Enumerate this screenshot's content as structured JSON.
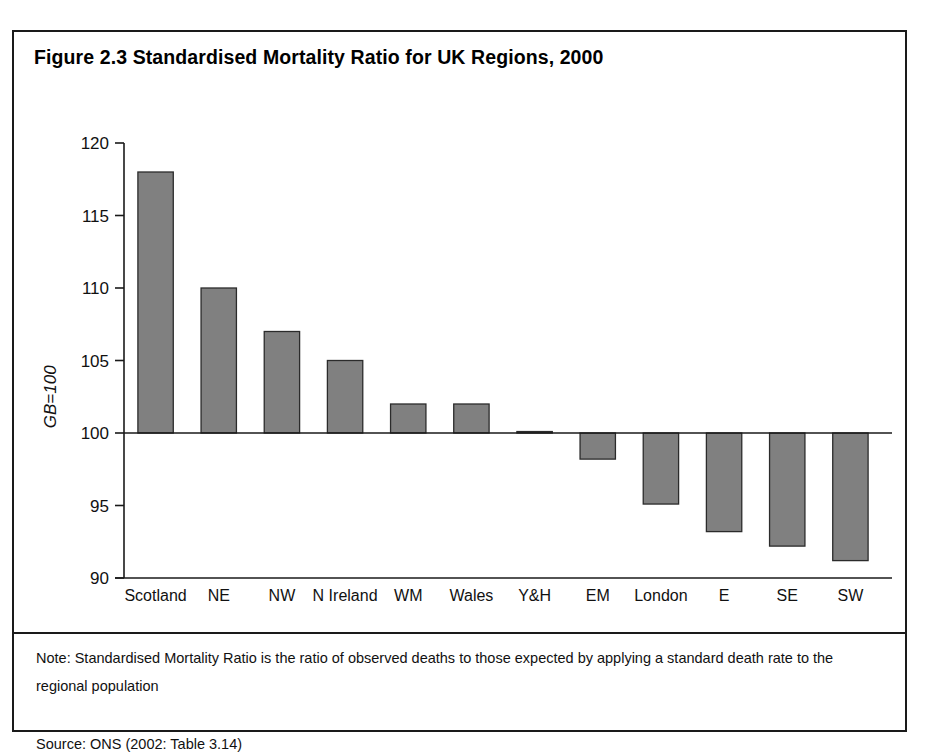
{
  "figure": {
    "title": "Figure 2.3 Standardised Mortality Ratio for UK Regions, 2000",
    "note": "Note: Standardised Mortality Ratio is the ratio of observed deaths to those expected by applying a standard death rate to the regional population",
    "source": "Source: ONS (2002: Table 3.14)"
  },
  "chart_data": {
    "type": "bar",
    "title": "Figure 2.3 Standardised Mortality Ratio for UK Regions, 2000",
    "xlabel": "",
    "ylabel": "GB=100",
    "ylim": [
      90,
      120
    ],
    "yticks": [
      90,
      95,
      100,
      105,
      110,
      115,
      120
    ],
    "baseline": 100,
    "grid": false,
    "legend": false,
    "bar_color": "#808080",
    "bar_edge_color": "#2b2b2b",
    "categories": [
      "Scotland",
      "NE",
      "NW",
      "N Ireland",
      "WM",
      "Wales",
      "Y&H",
      "EM",
      "London",
      "E",
      "SE",
      "SW"
    ],
    "values": [
      118,
      110,
      107,
      105,
      102,
      102,
      100.1,
      98.2,
      95.1,
      93.2,
      92.2,
      91.2
    ]
  }
}
